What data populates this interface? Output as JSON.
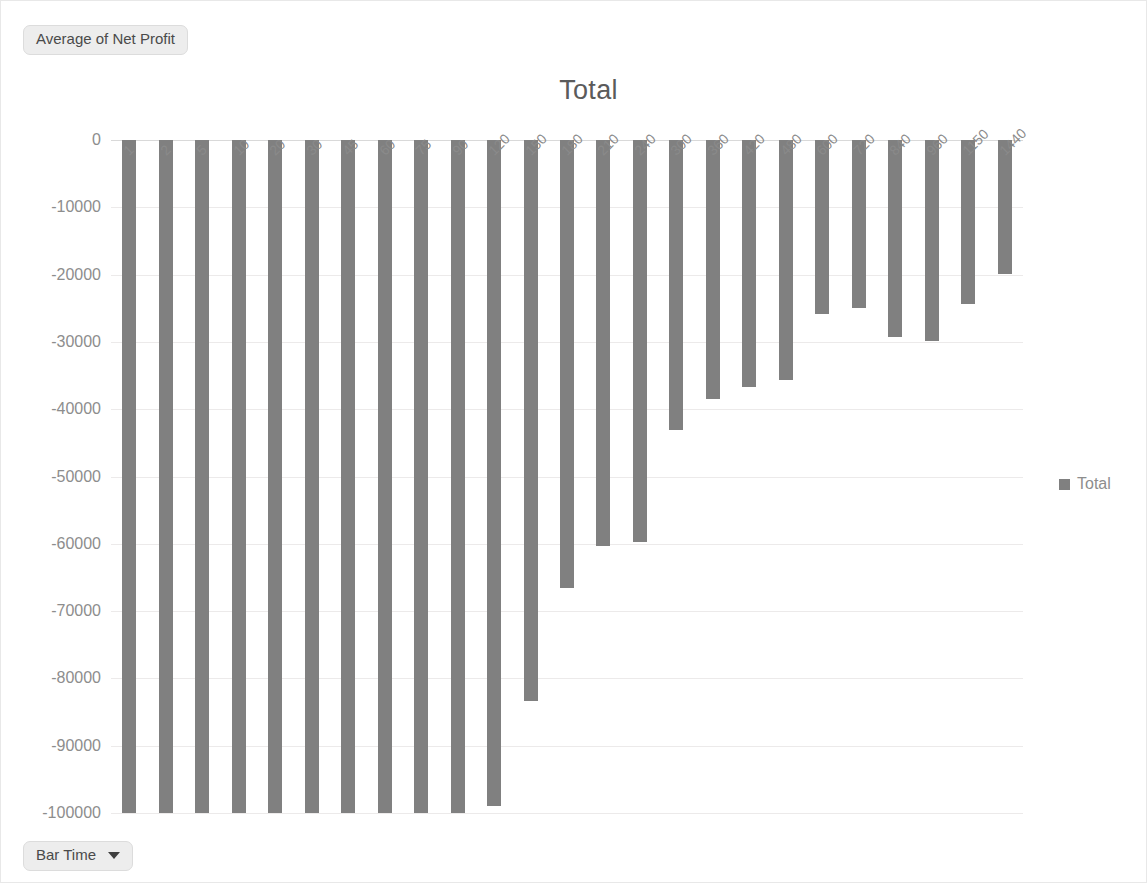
{
  "window": {
    "value_field_label": "Average of Net Profit",
    "axis_field_label": "Bar Time",
    "caret_icon": "chevron-down-icon"
  },
  "legend": {
    "position": "right",
    "entries": [
      {
        "label": "Total",
        "color": "#808080"
      }
    ]
  },
  "chart_data": {
    "type": "bar",
    "title": "Total",
    "xlabel": "",
    "ylabel": "",
    "ylim": [
      -100000,
      0
    ],
    "grid": true,
    "yticks": [
      0,
      -10000,
      -20000,
      -30000,
      -40000,
      -50000,
      -60000,
      -70000,
      -80000,
      -90000,
      -100000
    ],
    "ytick_labels": [
      "0",
      "-10000",
      "-20000",
      "-30000",
      "-40000",
      "-50000",
      "-60000",
      "-70000",
      "-80000",
      "-90000",
      "-100000"
    ],
    "categories": [
      "1",
      "2",
      "5",
      "10",
      "20",
      "30",
      "45",
      "60",
      "75",
      "90",
      "120",
      "150",
      "180",
      "210",
      "240",
      "300",
      "360",
      "420",
      "480",
      "600",
      "720",
      "840",
      "960",
      "1150",
      "1440"
    ],
    "series": [
      {
        "name": "Total",
        "color": "#808080",
        "values": [
          -100000,
          -100000,
          -100000,
          -100000,
          -100000,
          -100000,
          -100000,
          -100000,
          -100000,
          -100000,
          -99000,
          -83300,
          -66600,
          -60400,
          -59800,
          -43100,
          -38500,
          -36700,
          -35600,
          -25800,
          -24900,
          -29300,
          -29800,
          -24400,
          -19900
        ]
      }
    ]
  }
}
